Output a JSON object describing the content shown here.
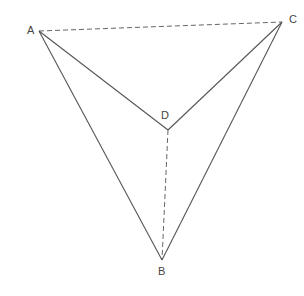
{
  "diagram": {
    "type": "geometry-figure",
    "points": {
      "A": {
        "label": "A",
        "x": 39,
        "y": 31,
        "lx": 27,
        "ly": 34
      },
      "B": {
        "label": "B",
        "x": 162,
        "y": 260,
        "lx": 158,
        "ly": 275
      },
      "C": {
        "label": "C",
        "x": 282,
        "y": 22,
        "lx": 289,
        "ly": 23
      },
      "D": {
        "label": "D",
        "x": 168,
        "y": 130,
        "lx": 161,
        "ly": 119
      }
    },
    "segments": [
      {
        "from": "A",
        "to": "B",
        "style": "solid"
      },
      {
        "from": "C",
        "to": "B",
        "style": "solid"
      },
      {
        "from": "A",
        "to": "D",
        "style": "solid"
      },
      {
        "from": "C",
        "to": "D",
        "style": "solid"
      },
      {
        "from": "A",
        "to": "C",
        "style": "dashed"
      },
      {
        "from": "D",
        "to": "B",
        "style": "dashed"
      }
    ],
    "colors": {
      "line": "#555555",
      "dashed": "#666666",
      "label": "#444444",
      "background": "#ffffff"
    }
  }
}
